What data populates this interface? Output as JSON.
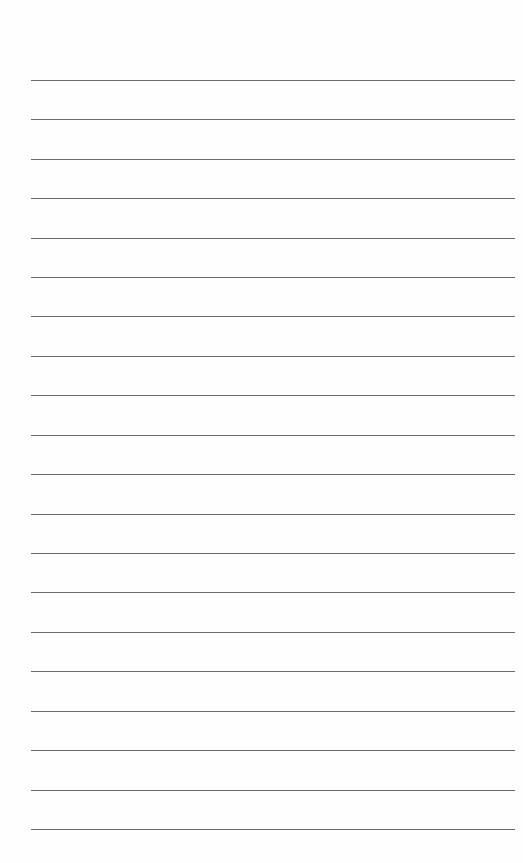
{
  "document": {
    "type": "lined-paper",
    "background_color": "#fefefe",
    "line_color": "#6a6a6a",
    "line_count": 20,
    "first_line_y": 80,
    "line_spacing": 39.4,
    "line_left": 31,
    "line_width": 484,
    "lines": [
      {
        "y": 80
      },
      {
        "y": 119
      },
      {
        "y": 159
      },
      {
        "y": 198
      },
      {
        "y": 238
      },
      {
        "y": 277
      },
      {
        "y": 316
      },
      {
        "y": 356
      },
      {
        "y": 395
      },
      {
        "y": 435
      },
      {
        "y": 474
      },
      {
        "y": 514
      },
      {
        "y": 553
      },
      {
        "y": 592
      },
      {
        "y": 632
      },
      {
        "y": 671
      },
      {
        "y": 711
      },
      {
        "y": 750
      },
      {
        "y": 790
      },
      {
        "y": 829
      }
    ]
  }
}
